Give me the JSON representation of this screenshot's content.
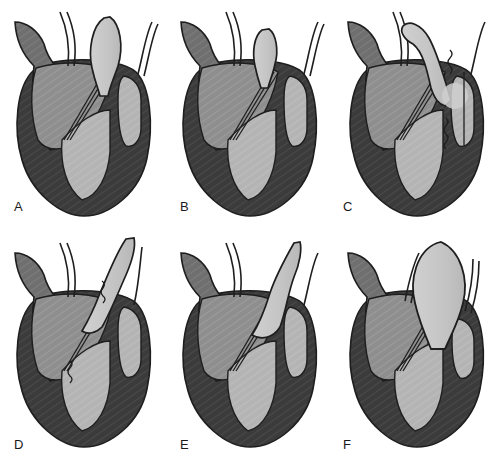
{
  "figure": {
    "background_color": "#ffffff",
    "width": 503,
    "height": 462,
    "rows": 2,
    "columns": 3
  },
  "palette": {
    "outline": "#1e1e1e",
    "myocardium_dark": "#3b3b3b",
    "chamber_mid": "#8e8e8e",
    "chamber_light": "#b4b4b4",
    "balloon_light": "#c6c6c6",
    "vessel_gray": "#6f6f6f",
    "white": "#ffffff",
    "label_color": "#1a1a1a"
  },
  "panels": [
    {
      "id": "A",
      "label": "A",
      "position": "top-left",
      "device_shape": "straight-vertical-teardrop",
      "device_description": "Light gray teardrop balloon seated vertically in the outflow tract, widest at mid-height, tapering to a narrow neck at the valve plane",
      "has_suture_marks": false
    },
    {
      "id": "B",
      "label": "B",
      "position": "top-center",
      "device_shape": "small-narrow-teardrop",
      "device_description": "Smaller narrow light gray teardrop, shorter and thinner than panel A, positioned in the outflow tract",
      "has_suture_marks": false
    },
    {
      "id": "C",
      "label": "C",
      "position": "top-right",
      "device_shape": "curved-hook",
      "device_description": "Elongated light gray hooked conduit curving up and over to the left, with suture squiggle markers and a straight vertical guide line on the right chamber",
      "has_suture_marks": true
    },
    {
      "id": "D",
      "label": "D",
      "position": "bottom-left",
      "device_shape": "diagonal-curved-conduit",
      "device_description": "Light gray conduit angled diagonally from upper right down into the left ventricle, with two suture squiggle markers along its course",
      "has_suture_marks": true
    },
    {
      "id": "E",
      "label": "E",
      "position": "bottom-center",
      "device_shape": "s-curve-conduit",
      "device_description": "Light gray S-curved conduit sweeping from the top down into the ventricular cavity with a flared tip",
      "has_suture_marks": false
    },
    {
      "id": "F",
      "label": "F",
      "position": "bottom-right",
      "device_shape": "large-bulbous-balloon",
      "device_description": "Large rounded light gray bulb with a narrow neck, the biggest device of the series, sitting above the valve plane",
      "has_suture_marks": false
    }
  ],
  "anatomy_labels": {
    "aortic_stump": "aorta",
    "left_atrium": "left atrium",
    "left_ventricle": "left ventricle",
    "right_ventricle": "right ventricle",
    "mitral_valve": "mitral valve leaflets",
    "vessels": "great vessels"
  }
}
